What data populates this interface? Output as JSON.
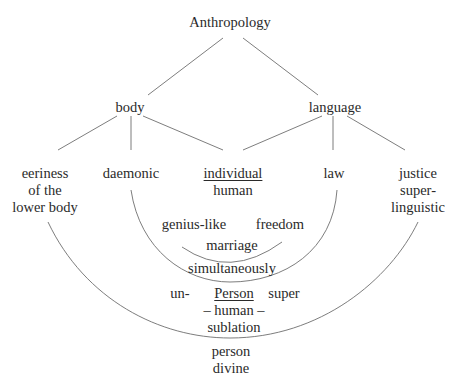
{
  "diagram": {
    "type": "concept-tree",
    "line_color": "#6e6e6e",
    "text_color": "#2a2a2a",
    "root": {
      "label": "Anthropology"
    },
    "level1": [
      {
        "id": "body",
        "label": "body"
      },
      {
        "id": "language",
        "label": "language"
      }
    ],
    "level2": {
      "eeriness": {
        "lines": [
          "eeriness",
          "of the",
          "lower body"
        ]
      },
      "daemonic": {
        "lines": [
          "daemonic"
        ]
      },
      "individual": {
        "lines": [
          "individual",
          "human"
        ],
        "underlined_first": true
      },
      "law": {
        "lines": [
          "law"
        ]
      },
      "justice": {
        "lines": [
          "justice",
          "super-",
          "linguistic"
        ]
      }
    },
    "inner_arc": {
      "left": "genius-like",
      "right": "freedom",
      "bottom": "marriage"
    },
    "middle_arc": {
      "bottom": "simultaneously"
    },
    "center": {
      "prefix": "un-",
      "title": "Person",
      "suffix": "super",
      "line2": "– human –",
      "line3": "sublation"
    },
    "bottom": {
      "line1": "person",
      "line2": "divine"
    },
    "edges": [
      [
        "Anthropology",
        "body"
      ],
      [
        "Anthropology",
        "language"
      ],
      [
        "body",
        "eeriness of the lower body"
      ],
      [
        "body",
        "daemonic"
      ],
      [
        "body",
        "individual human"
      ],
      [
        "language",
        "individual human"
      ],
      [
        "language",
        "law"
      ],
      [
        "language",
        "justice super-linguistic"
      ]
    ],
    "arcs": [
      [
        "genius-like",
        "freedom",
        "through marriage"
      ],
      [
        "daemonic",
        "law",
        "through simultaneously"
      ],
      [
        "eeriness of the lower body",
        "justice super-linguistic",
        "through sublation"
      ]
    ]
  }
}
